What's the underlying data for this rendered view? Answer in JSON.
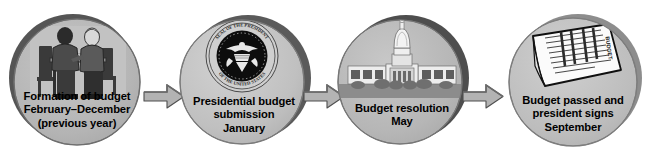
{
  "diagram": {
    "background_color": "#ffffff",
    "circle_fill": "#b4b4b4",
    "circle_shadow_color": "#4a4a4a",
    "circle_outline_color": "#6e6e6e",
    "arrow_fill": "#b0b0b0",
    "arrow_outline_color": "#4f4f4f",
    "text_color": "#000000"
  },
  "stages": [
    {
      "id": "formation-of-budget",
      "icon": "two-people-at-table-icon",
      "icon_description": "Two people seated at a table reviewing papers",
      "label_lines": [
        "Formation of budget",
        "February–December",
        "(previous year)"
      ]
    },
    {
      "id": "presidential-budget-submission",
      "icon": "presidential-seal-icon",
      "icon_description": "Seal of the President of the United States",
      "seal_text_outer": "SEAL OF THE PRESIDENT OF THE UNITED STATES",
      "label_lines": [
        "Presidential budget",
        "submission",
        "January"
      ]
    },
    {
      "id": "budget-resolution",
      "icon": "capitol-building-icon",
      "icon_description": "United States Capitol building",
      "label_lines": [
        "Budget resolution",
        "May"
      ]
    },
    {
      "id": "budget-passed-president-signs",
      "icon": "signed-document-icon",
      "icon_description": "A printed budget document sheet",
      "label_lines": [
        "Budget passed and",
        "president signs",
        "September"
      ]
    }
  ],
  "arrows": [
    {
      "id": "arrow-1",
      "direction": "right",
      "from": "formation-of-budget",
      "to": "presidential-budget-submission"
    },
    {
      "id": "arrow-2",
      "direction": "right",
      "from": "presidential-budget-submission",
      "to": "budget-resolution"
    },
    {
      "id": "arrow-3",
      "direction": "right",
      "from": "budget-resolution",
      "to": "budget-passed-president-signs"
    }
  ]
}
